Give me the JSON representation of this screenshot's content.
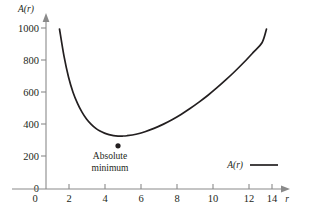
{
  "chart_data": {
    "type": "line",
    "title": "",
    "subtitle": "",
    "xlabel": "r",
    "ylabel": "A(r)",
    "xlim": [
      0,
      15
    ],
    "ylim": [
      0,
      1100
    ],
    "grid": false,
    "legend_position": "bottom-right",
    "legend": [
      "A(r)"
    ],
    "x_ticks": [
      0,
      2,
      4,
      6,
      8,
      10,
      12,
      14
    ],
    "x_tick_labels": [
      "0",
      "2",
      "4",
      "6",
      "8",
      "10",
      "12",
      "14"
    ],
    "y_ticks": [
      0,
      200,
      400,
      600,
      800,
      1000
    ],
    "y_tick_labels": [
      "0",
      "200",
      "400",
      "600",
      "800",
      "1000"
    ],
    "series": [
      {
        "name": "A(r)",
        "x": [
          0.75,
          1.0,
          1.25,
          1.5,
          1.75,
          2.0,
          2.25,
          2.5,
          2.75,
          3.0,
          3.25,
          3.5,
          3.75,
          4.0,
          4.25,
          4.5,
          5.0,
          5.5,
          6.0,
          6.5,
          7.0,
          7.5,
          8.0,
          8.5,
          9.0,
          9.5,
          10.0,
          10.5,
          11.0,
          11.5,
          12.0,
          12.25
        ],
        "y": [
          1000,
          830,
          700,
          605,
          535,
          480,
          437,
          405,
          380,
          362,
          349,
          340,
          334,
          331,
          331,
          333,
          342,
          358,
          379,
          404,
          433,
          466,
          503,
          543,
          586,
          633,
          683,
          736,
          792,
          852,
          914,
          1000
        ]
      }
    ],
    "annotations": [
      {
        "name": "absolute-minimum",
        "text_line1": "Absolute",
        "text_line2": "minimum",
        "x": 4,
        "y": 270,
        "marker": "dot"
      }
    ]
  },
  "figure": {
    "y_axis_title": "A(r)",
    "x_axis_title": "r"
  },
  "colors": {
    "curve": "#231f20",
    "axis": "#8a8a8a",
    "text": "#231f20",
    "background": "#ffffff"
  }
}
